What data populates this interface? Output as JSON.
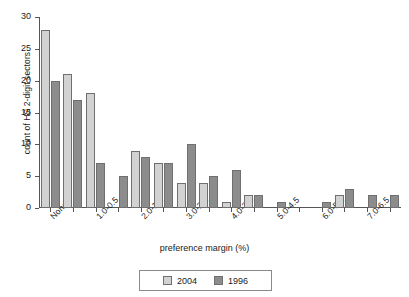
{
  "chart_data": {
    "type": "bar",
    "title": "",
    "xlabel": "preference margin (%)",
    "ylabel": "count of HS 2-digit sectors",
    "ylim": [
      0,
      30
    ],
    "yticks": [
      0,
      5,
      10,
      15,
      20,
      25,
      30
    ],
    "grid": false,
    "legend_position": "bottom-center",
    "categories": [
      "None",
      "",
      "1.0-0.5",
      "",
      "2.0-1.5",
      "",
      "3.0-2.5",
      "",
      "4.0-3.5",
      "",
      "5.0-4.5",
      "",
      "6.0-5.5",
      "",
      "7.0-6.5",
      ""
    ],
    "tick_labels": [
      "None",
      "1.0-0.5",
      "2.0-1.5",
      "3.0-2.5",
      "4.0-3.5",
      "5.0-4.5",
      "6.0-5.5",
      "7.0-6.5"
    ],
    "series": [
      {
        "name": "2004",
        "color": "#d2d2d2",
        "values": [
          28,
          21,
          18,
          0,
          9,
          7,
          4,
          4,
          1,
          2,
          0,
          0,
          0,
          2,
          0,
          0
        ]
      },
      {
        "name": "1996",
        "color": "#8c8c8c",
        "values": [
          20,
          17,
          7,
          5,
          8,
          7,
          10,
          5,
          6,
          2,
          1,
          0,
          1,
          3,
          2,
          2
        ]
      }
    ]
  },
  "axes": {
    "y_title": "count of HS 2-digit sectors",
    "x_title": "preference margin (%)",
    "y_tick_labels": [
      "0",
      "5",
      "10",
      "15",
      "20",
      "25",
      "30"
    ],
    "x_tick_labels": [
      "None",
      "1.0-0.5",
      "2.0-1.5",
      "3.0-2.5",
      "4.0-3.5",
      "5.0-4.5",
      "6.0-5.5",
      "7.0-6.5"
    ]
  },
  "legend": {
    "items": [
      {
        "label": "2004",
        "color": "#d2d2d2"
      },
      {
        "label": "1996",
        "color": "#8c8c8c"
      }
    ]
  }
}
